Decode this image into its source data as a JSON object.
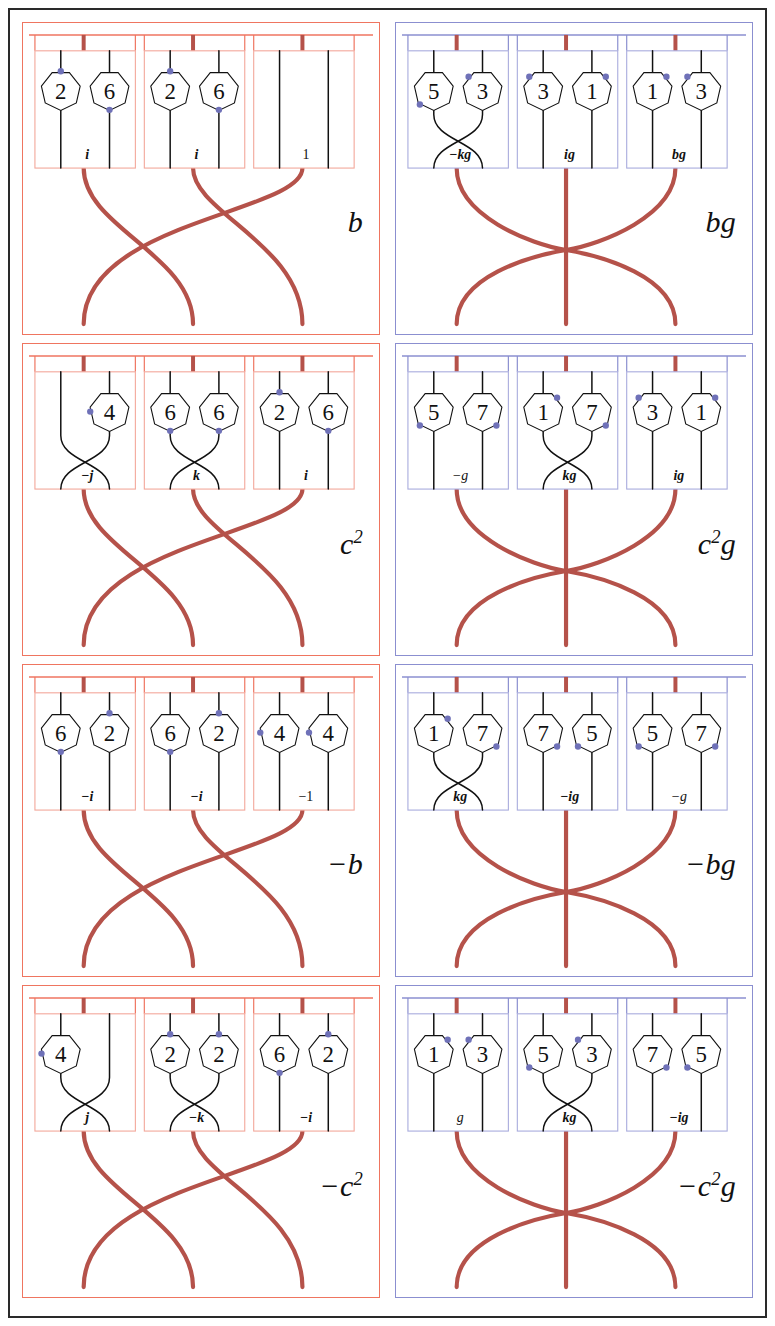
{
  "figure": {
    "columns": 2,
    "rows": 4,
    "colors": {
      "outer_frame": "#2a2a2a",
      "left_panel_border": "#ef7560",
      "right_panel_border": "#8b8fd0",
      "left_subbox_border": "#f3a79a",
      "right_subbox_border": "#a8abdd",
      "strand_red": "#b5524a",
      "strand_black": "#111111",
      "dot_blue": "#6f71b8",
      "background": "#ffffff"
    },
    "braid_types": {
      "left": "three-cycle",
      "right": "outer-swap-center"
    }
  },
  "panels": [
    {
      "id": "panel-b",
      "side": "left",
      "label": "b",
      "label_parts": {
        "sign": "",
        "base": "b",
        "exp": "",
        "suffix": ""
      },
      "boxes": [
        {
          "id": "box-b-1",
          "braid": "parallel",
          "nodes": [
            {
              "value": "2",
              "dot": "top"
            },
            {
              "value": "6",
              "dot": "bottom"
            }
          ],
          "label": "i",
          "label_style": "bold-italic"
        },
        {
          "id": "box-b-2",
          "braid": "parallel",
          "nodes": [
            {
              "value": "2",
              "dot": "top"
            },
            {
              "value": "6",
              "dot": "bottom"
            }
          ],
          "label": "i",
          "label_style": "bold-italic"
        },
        {
          "id": "box-b-3",
          "braid": "parallel",
          "nodes": [
            {
              "value": "",
              "dot": "none"
            },
            {
              "value": "",
              "dot": "none"
            }
          ],
          "label": "1",
          "label_style": "upright"
        }
      ]
    },
    {
      "id": "panel-bg",
      "side": "right",
      "label": "bg",
      "label_parts": {
        "sign": "",
        "base": "b",
        "exp": "",
        "suffix": "g"
      },
      "boxes": [
        {
          "id": "box-bg-1",
          "braid": "cross",
          "nodes": [
            {
              "value": "5",
              "dot": "lower-left"
            },
            {
              "value": "3",
              "dot": "upper-left"
            }
          ],
          "label": "−kg",
          "label_style": "bold-italic-mixed"
        },
        {
          "id": "box-bg-2",
          "braid": "parallel",
          "nodes": [
            {
              "value": "3",
              "dot": "upper-left"
            },
            {
              "value": "1",
              "dot": "upper-right"
            }
          ],
          "label": "ig",
          "label_style": "bold-italic-mixed"
        },
        {
          "id": "box-bg-3",
          "braid": "parallel",
          "nodes": [
            {
              "value": "1",
              "dot": "upper-right"
            },
            {
              "value": "3",
              "dot": "upper-left"
            }
          ],
          "label": "bg",
          "label_style": "bold-italic-mixed"
        }
      ]
    },
    {
      "id": "panel-c2",
      "side": "left",
      "label": "c²",
      "label_parts": {
        "sign": "",
        "base": "c",
        "exp": "2",
        "suffix": ""
      },
      "boxes": [
        {
          "id": "box-c2-1",
          "braid": "cross",
          "nodes": [
            {
              "value": "",
              "dot": "none"
            },
            {
              "value": "4",
              "dot": "left"
            }
          ],
          "label": "−j",
          "label_style": "bold-italic"
        },
        {
          "id": "box-c2-2",
          "braid": "cross",
          "nodes": [
            {
              "value": "6",
              "dot": "bottom"
            },
            {
              "value": "6",
              "dot": "bottom"
            }
          ],
          "label": "k",
          "label_style": "bold-italic"
        },
        {
          "id": "box-c2-3",
          "braid": "parallel",
          "nodes": [
            {
              "value": "2",
              "dot": "top"
            },
            {
              "value": "6",
              "dot": "bottom"
            }
          ],
          "label": "i",
          "label_style": "bold-italic"
        }
      ]
    },
    {
      "id": "panel-c2g",
      "side": "right",
      "label": "c²g",
      "label_parts": {
        "sign": "",
        "base": "c",
        "exp": "2",
        "suffix": "g"
      },
      "boxes": [
        {
          "id": "box-c2g-1",
          "braid": "parallel",
          "nodes": [
            {
              "value": "5",
              "dot": "lower-left"
            },
            {
              "value": "7",
              "dot": "lower-right"
            }
          ],
          "label": "−g",
          "label_style": "italic"
        },
        {
          "id": "box-c2g-2",
          "braid": "cross",
          "nodes": [
            {
              "value": "1",
              "dot": "upper-right"
            },
            {
              "value": "7",
              "dot": "lower-right"
            }
          ],
          "label": "kg",
          "label_style": "bold-italic-mixed"
        },
        {
          "id": "box-c2g-3",
          "braid": "parallel",
          "nodes": [
            {
              "value": "3",
              "dot": "upper-left"
            },
            {
              "value": "1",
              "dot": "upper-right"
            }
          ],
          "label": "ig",
          "label_style": "bold-italic-mixed"
        }
      ]
    },
    {
      "id": "panel-minus-b",
      "side": "left",
      "label": "−b",
      "label_parts": {
        "sign": "−",
        "base": "b",
        "exp": "",
        "suffix": ""
      },
      "boxes": [
        {
          "id": "box-mb-1",
          "braid": "parallel",
          "nodes": [
            {
              "value": "6",
              "dot": "bottom"
            },
            {
              "value": "2",
              "dot": "top"
            }
          ],
          "label": "−i",
          "label_style": "bold-italic"
        },
        {
          "id": "box-mb-2",
          "braid": "parallel",
          "nodes": [
            {
              "value": "6",
              "dot": "bottom"
            },
            {
              "value": "2",
              "dot": "top"
            }
          ],
          "label": "−i",
          "label_style": "bold-italic"
        },
        {
          "id": "box-mb-3",
          "braid": "parallel",
          "nodes": [
            {
              "value": "4",
              "dot": "left"
            },
            {
              "value": "4",
              "dot": "left"
            }
          ],
          "label": "−1",
          "label_style": "upright"
        }
      ]
    },
    {
      "id": "panel-minus-bg",
      "side": "right",
      "label": "−bg",
      "label_parts": {
        "sign": "−",
        "base": "b",
        "exp": "",
        "suffix": "g"
      },
      "boxes": [
        {
          "id": "box-mbg-1",
          "braid": "cross",
          "nodes": [
            {
              "value": "1",
              "dot": "upper-right"
            },
            {
              "value": "7",
              "dot": "lower-right"
            }
          ],
          "label": "kg",
          "label_style": "bold-italic-mixed"
        },
        {
          "id": "box-mbg-2",
          "braid": "parallel",
          "nodes": [
            {
              "value": "7",
              "dot": "lower-right"
            },
            {
              "value": "5",
              "dot": "lower-left"
            }
          ],
          "label": "−ig",
          "label_style": "bold-italic-mixed"
        },
        {
          "id": "box-mbg-3",
          "braid": "parallel",
          "nodes": [
            {
              "value": "5",
              "dot": "lower-left"
            },
            {
              "value": "7",
              "dot": "lower-right"
            }
          ],
          "label": "−g",
          "label_style": "italic"
        }
      ]
    },
    {
      "id": "panel-minus-c2",
      "side": "left",
      "label": "−c²",
      "label_parts": {
        "sign": "−",
        "base": "c",
        "exp": "2",
        "suffix": ""
      },
      "boxes": [
        {
          "id": "box-mc2-1",
          "braid": "cross",
          "nodes": [
            {
              "value": "4",
              "dot": "left"
            },
            {
              "value": "",
              "dot": "none"
            }
          ],
          "label": "j",
          "label_style": "bold-italic"
        },
        {
          "id": "box-mc2-2",
          "braid": "cross",
          "nodes": [
            {
              "value": "2",
              "dot": "top"
            },
            {
              "value": "2",
              "dot": "top"
            }
          ],
          "label": "−k",
          "label_style": "bold-italic"
        },
        {
          "id": "box-mc2-3",
          "braid": "parallel",
          "nodes": [
            {
              "value": "6",
              "dot": "bottom"
            },
            {
              "value": "2",
              "dot": "top"
            }
          ],
          "label": "−i",
          "label_style": "bold-italic"
        }
      ]
    },
    {
      "id": "panel-minus-c2g",
      "side": "right",
      "label": "−c²g",
      "label_parts": {
        "sign": "−",
        "base": "c",
        "exp": "2",
        "suffix": "g"
      },
      "boxes": [
        {
          "id": "box-mc2g-1",
          "braid": "parallel",
          "nodes": [
            {
              "value": "1",
              "dot": "upper-right"
            },
            {
              "value": "3",
              "dot": "upper-left"
            }
          ],
          "label": "g",
          "label_style": "italic"
        },
        {
          "id": "box-mc2g-2",
          "braid": "cross",
          "nodes": [
            {
              "value": "5",
              "dot": "lower-left"
            },
            {
              "value": "3",
              "dot": "upper-left"
            }
          ],
          "label": "kg",
          "label_style": "bold-italic-mixed"
        },
        {
          "id": "box-mc2g-3",
          "braid": "parallel",
          "nodes": [
            {
              "value": "7",
              "dot": "lower-right"
            },
            {
              "value": "5",
              "dot": "lower-left"
            }
          ],
          "label": "−ig",
          "label_style": "bold-italic-mixed"
        }
      ]
    }
  ]
}
